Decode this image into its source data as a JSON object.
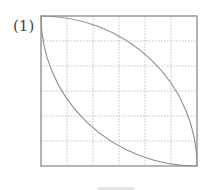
{
  "figure": {
    "label": "(1)",
    "grid": {
      "rows": 6,
      "cols": 6,
      "line_style": "dashed"
    },
    "square": {
      "x": 41,
      "y": 16,
      "width": 156,
      "height": 150
    },
    "arcs": [
      {
        "name": "arc-top-left-to-bottom-right-upper",
        "from": "top-left",
        "to": "bottom-right",
        "bulge": "upper-right"
      },
      {
        "name": "arc-top-left-to-bottom-right-lower",
        "from": "top-left",
        "to": "bottom-right",
        "bulge": "lower-left"
      }
    ],
    "colors": {
      "border": "#8a8a8a",
      "grid": "#b5b5b5",
      "arc": "#8f8f8f"
    }
  }
}
